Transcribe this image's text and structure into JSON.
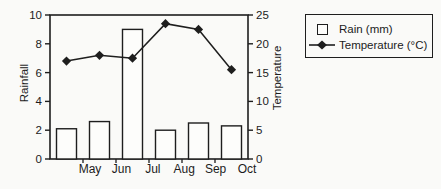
{
  "chart_data": {
    "type": "bar",
    "subtype": "combo-bar-line",
    "categories": [
      "May",
      "Jun",
      "Jul",
      "Aug",
      "Sep",
      "Oct"
    ],
    "series": [
      {
        "name": "Rain (mm)",
        "type": "bar",
        "axis": "left",
        "values": [
          2.1,
          2.6,
          9,
          2,
          2.5,
          2.3
        ]
      },
      {
        "name": "Temperature (°C)",
        "type": "line",
        "axis": "right",
        "marker": "diamond",
        "values": [
          17,
          18,
          17.5,
          23.5,
          22.5,
          15.5
        ]
      }
    ],
    "left_axis": {
      "label": "Rainfall",
      "min": 0,
      "max": 10,
      "ticks": [
        0,
        2,
        4,
        6,
        8,
        10
      ]
    },
    "right_axis": {
      "label": "Temperature",
      "min": 0,
      "max": 25,
      "ticks": [
        0,
        5,
        10,
        15,
        20,
        25
      ]
    },
    "grid": false,
    "legend_position": "outside-top-right"
  },
  "legend": {
    "rain_label": "Rain (mm)",
    "temperature_label": "Temperature (°C)"
  },
  "colors": {
    "ink": "#1e1e1e",
    "text": "#1c1c1c",
    "bar_fill": "#fdfdfb",
    "background": "#fafaf8"
  }
}
